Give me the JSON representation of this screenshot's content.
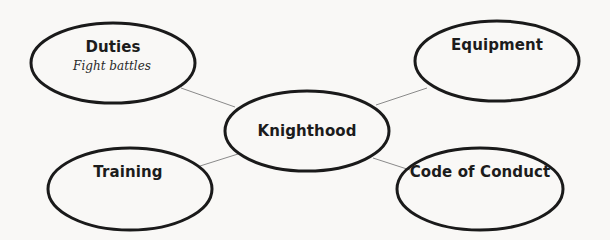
{
  "diagram": {
    "type": "concept-web",
    "colors": {
      "background": "#f9f8f6",
      "ellipse_stroke": "#1a1a1a",
      "connector": "#8a8a8a",
      "text": "#1c1c1c"
    },
    "center": {
      "label": "Knighthood"
    },
    "nodes": [
      {
        "id": "duties",
        "label": "Duties",
        "note": "Fight battles",
        "position": "top-left"
      },
      {
        "id": "equipment",
        "label": "Equipment",
        "note": "",
        "position": "top-right"
      },
      {
        "id": "training",
        "label": "Training",
        "note": "",
        "position": "bottom-left"
      },
      {
        "id": "code-of-conduct",
        "label": "Code of Conduct",
        "note": "",
        "position": "bottom-right"
      }
    ]
  }
}
